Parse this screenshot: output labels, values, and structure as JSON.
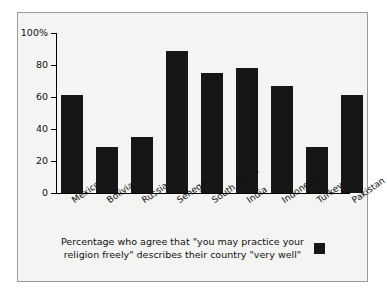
{
  "chart_data": {
    "type": "bar",
    "title": "",
    "xlabel": "",
    "ylabel": "",
    "categories": [
      "Mexico",
      "Bolivia",
      "Russia",
      "Senegal",
      "South Africa",
      "India",
      "Indonesia",
      "Turkey",
      "Pakistan"
    ],
    "values": [
      61,
      29,
      35,
      89,
      75,
      78,
      67,
      29,
      61
    ],
    "ylim": [
      0,
      100
    ],
    "yticks": [
      0,
      20,
      40,
      60,
      80,
      100
    ],
    "ytick_labels": [
      "0",
      "20",
      "40",
      "60",
      "80",
      "100%"
    ],
    "grid": false,
    "legend_position": "bottom",
    "legend": [
      "Percentage who agree that \"you may practice your\nreligion freely\" describes their country \"very well\""
    ],
    "bar_color": "#161616",
    "background_color": "#f4f4f2",
    "frame_color": "#9a9a9a"
  },
  "legend": {
    "text": "Percentage who agree that \"you may practice your\nreligion freely\" describes their country \"very well\"",
    "swatch_name": "legend-color-swatch"
  }
}
